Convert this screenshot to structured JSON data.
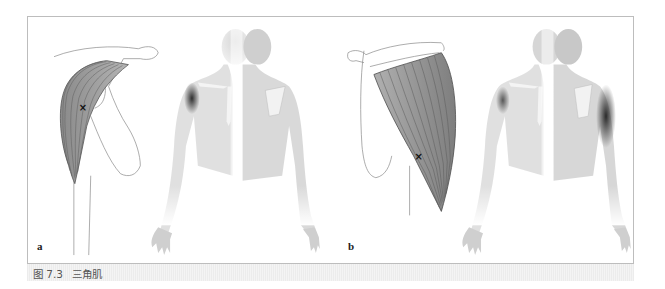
{
  "figure": {
    "caption": {
      "number": "图 7.3",
      "title": "三角肌"
    },
    "panels": [
      {
        "label": "a",
        "muscle_view": "anterior-deltoid",
        "trigger_point_marker": "×",
        "referral_pattern": "front-shoulder"
      },
      {
        "label": "b",
        "muscle_view": "posterior-deltoid",
        "trigger_point_marker": "×",
        "referral_pattern": "back-shoulder"
      }
    ],
    "colors": {
      "frame_border": "#bdbdbd",
      "caption_bg": "#eeeeee",
      "caption_text": "#555555",
      "muscle_fill": "#9a9a9a",
      "muscle_lines": "#5a5a5a",
      "body_skin": "#d8d8d8",
      "referral_pain": "#3a3a3a"
    }
  }
}
